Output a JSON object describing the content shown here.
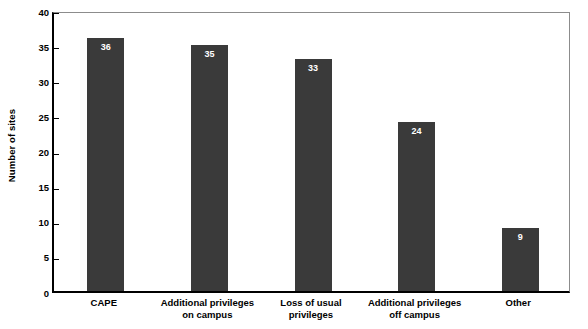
{
  "chart_data": {
    "type": "bar",
    "title": "",
    "xlabel": "",
    "ylabel": "Number of sites",
    "categories": [
      "CAPE",
      "Additional privileges on campus",
      "Loss of usual privileges",
      "Additional privileges off campus",
      "Other"
    ],
    "category_lines": [
      [
        "CAPE"
      ],
      [
        "Additional privileges",
        "on campus"
      ],
      [
        "Loss of usual",
        "privileges"
      ],
      [
        "Additional privileges",
        "off campus"
      ],
      [
        "Other"
      ]
    ],
    "values": [
      36,
      35,
      33,
      24,
      9
    ],
    "value_labels": [
      "36",
      "35",
      "33",
      "24",
      "9"
    ],
    "ylim": [
      0,
      40
    ],
    "ytick_values": [
      0,
      5,
      10,
      15,
      20,
      25,
      30,
      35,
      40
    ],
    "ytick_labels": [
      "0",
      "5",
      "10",
      "15",
      "20",
      "25",
      "30",
      "35",
      "40"
    ],
    "grid": false,
    "legend": "none",
    "bar_color": "#3a3a3a",
    "value_label_color": "#ffffff",
    "axis_color": "#000000",
    "frame_color": "#8c8c8c",
    "background_color": "#ffffff"
  }
}
